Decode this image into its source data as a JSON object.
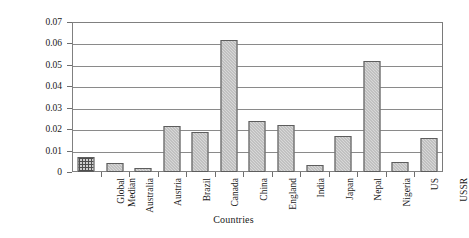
{
  "chart_data": {
    "type": "bar",
    "title": "",
    "xlabel": "Countries",
    "ylabel": "Concentration (mg/kg)",
    "ylim": [
      0,
      0.07
    ],
    "ytick_labels": [
      "0.07",
      "0.06",
      "0.05",
      "0.04",
      "0.03",
      "0.02",
      "0.01",
      "0"
    ],
    "ytick_values": [
      0.07,
      0.06,
      0.05,
      0.04,
      0.03,
      0.02,
      0.01,
      0
    ],
    "grid": true,
    "legend": "none",
    "categories": [
      "Global\nMedian",
      "Australia",
      "Austria",
      "Brazil",
      "Canada",
      "China",
      "England",
      "India",
      "Japan",
      "Nepal",
      "Nigeria",
      "US",
      "USSR"
    ],
    "values": [
      0.0068,
      0.004,
      0.002,
      0.0214,
      0.0187,
      0.0618,
      0.0237,
      0.022,
      0.0034,
      0.0168,
      0.0519,
      0.0045,
      0.0161
    ],
    "bar_fills": [
      "grid-hatch",
      "solid-gray",
      "solid-gray",
      "solid-gray",
      "solid-gray",
      "solid-gray",
      "solid-gray",
      "solid-gray",
      "solid-gray",
      "solid-gray",
      "solid-gray",
      "solid-gray",
      "solid-gray"
    ],
    "colors": {
      "bar_fill": "#a9a9a9",
      "bar_edge": "#5d5d5d",
      "grid": "#8a8a8a",
      "frame": "#808080",
      "background": "#ffffff",
      "text": "#1a1a1a"
    }
  }
}
